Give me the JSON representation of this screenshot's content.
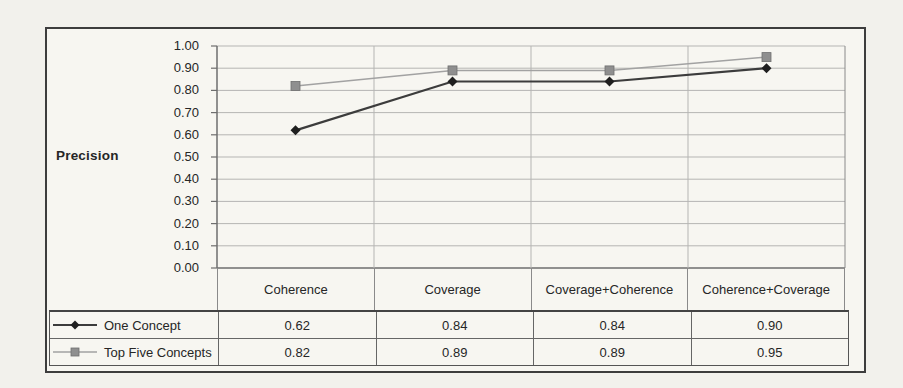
{
  "figure": {
    "ylabel": "Precision"
  },
  "chart_data": {
    "type": "line",
    "title": "",
    "xlabel": "",
    "ylabel": "Precision",
    "categories": [
      "Coherence",
      "Coverage",
      "Coverage+Coherence",
      "Coherence+Coverage"
    ],
    "series": [
      {
        "name": "One Concept",
        "marker": "diamond",
        "marker_color": "#1f1f1f",
        "line_color": "#3c3c3c",
        "values": [
          0.62,
          0.84,
          0.84,
          0.9
        ]
      },
      {
        "name": "Top Five Concepts",
        "marker": "square",
        "marker_color": "#8f8f8f",
        "line_color": "#a2a2a2",
        "values": [
          0.82,
          0.89,
          0.89,
          0.95
        ]
      }
    ],
    "ylim": [
      0,
      1
    ],
    "y_ticks": [
      "1.00",
      "0.90",
      "0.80",
      "0.70",
      "0.60",
      "0.50",
      "0.40",
      "0.30",
      "0.20",
      "0.10",
      "0.00"
    ],
    "grid": true,
    "legend_position": "table-left",
    "colors": {
      "gridline": "#b5b5b3",
      "axis": "#6e6e6e",
      "paper": "#f2f1ec",
      "frame_border": "#3d3d3d",
      "text": "#262626"
    }
  }
}
